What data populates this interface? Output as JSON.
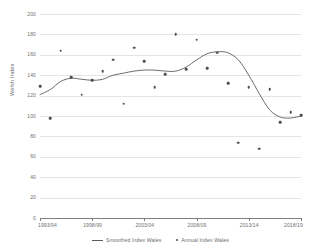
{
  "chart_data": {
    "type": "line",
    "title": "",
    "xlabel": "",
    "ylabel": "Welsh Index",
    "ylim": [
      0,
      200
    ],
    "ytick_step": 20,
    "yticks": [
      0,
      20,
      40,
      60,
      80,
      100,
      120,
      140,
      160,
      180,
      200
    ],
    "xticks": [
      "1993/94",
      "1998/99",
      "2003/04",
      "2008/09",
      "2013/14",
      "2018/19"
    ],
    "x": [
      "1993/94",
      "1994/95",
      "1995/96",
      "1996/97",
      "1997/98",
      "1998/99",
      "1999/00",
      "2000/01",
      "2001/02",
      "2002/03",
      "2003/04",
      "2004/05",
      "2005/06",
      "2006/07",
      "2007/08",
      "2008/09",
      "2009/10",
      "2010/11",
      "2011/12",
      "2012/13",
      "2013/14",
      "2014/15",
      "2015/16",
      "2016/17",
      "2017/18",
      "2018/19"
    ],
    "grid": true,
    "legend_position": "bottom",
    "series": [
      {
        "name": "Smoothed Index Wales",
        "style": "line",
        "color": "#5b5b5b",
        "values": [
          121,
          126,
          134,
          137,
          136,
          135,
          136,
          140,
          142,
          144,
          145,
          145,
          144,
          144,
          148,
          155,
          161,
          163,
          162,
          155,
          140,
          122,
          106,
          99,
          98,
          100
        ]
      },
      {
        "name": "Annual Index Wales",
        "style": "marker",
        "color": "#4d4d4d",
        "values": [
          129,
          98,
          164,
          138,
          121,
          135,
          144,
          155,
          112,
          167,
          154,
          128,
          141,
          180,
          146,
          175,
          147,
          162,
          132,
          74,
          128,
          68,
          126,
          94,
          104,
          101
        ]
      }
    ]
  },
  "legend": {
    "entries": [
      {
        "label": "Smoothed Index Wales",
        "marker": "line"
      },
      {
        "label": "Annual Index Wales",
        "marker": "dot"
      }
    ]
  },
  "axis": {
    "y_title": "Welsh Index"
  }
}
